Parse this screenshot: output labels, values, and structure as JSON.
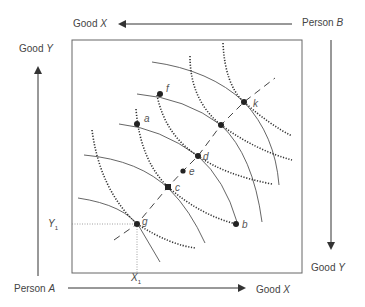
{
  "diagram": {
    "type": "edgeworth-box",
    "labels": {
      "top_good": "Good",
      "top_good_var": "X",
      "top_person": "Person",
      "top_person_var": "B",
      "left_good": "Good",
      "left_good_var": "Y",
      "bottom_person": "Person",
      "bottom_person_var": "A",
      "bottom_good": "Good",
      "bottom_good_var": "X",
      "right_good": "Good",
      "right_good_var": "Y",
      "y1": "Y",
      "y1_sub": "1",
      "x1": "X",
      "x1_sub": "1"
    },
    "points": [
      {
        "name": "f",
        "x": 160,
        "y": 94
      },
      {
        "name": "a",
        "x": 137,
        "y": 124
      },
      {
        "name": "k",
        "x": 244,
        "y": 102
      },
      {
        "name": "",
        "x": 221,
        "y": 125
      },
      {
        "name": "d",
        "x": 198,
        "y": 156
      },
      {
        "name": "e",
        "x": 183,
        "y": 171
      },
      {
        "name": "c",
        "x": 168,
        "y": 187
      },
      {
        "name": "g",
        "x": 137,
        "y": 224
      },
      {
        "name": "b",
        "x": 236,
        "y": 224
      }
    ],
    "colors": {
      "line": "#555555",
      "point": "#222222",
      "box": "#666666"
    }
  }
}
